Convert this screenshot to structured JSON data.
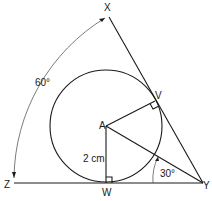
{
  "diagram": {
    "type": "geometry",
    "points": {
      "X": {
        "label": "X"
      },
      "Y": {
        "label": "Y"
      },
      "Z": {
        "label": "Z"
      },
      "A": {
        "label": "A"
      },
      "V": {
        "label": "V"
      },
      "W": {
        "label": "W"
      }
    },
    "measurements": {
      "radius_label": "2 cm",
      "angle_XYZ_label": "60°",
      "angle_AYW_label": "30°"
    },
    "right_angles": [
      "AVY",
      "AWY"
    ],
    "colors": {
      "stroke": "#1a1a1a",
      "background": "#ffffff"
    }
  }
}
